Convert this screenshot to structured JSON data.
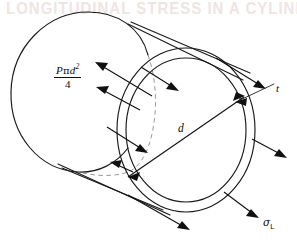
{
  "figure": {
    "kind": "engineering-diagram",
    "background_color": "#ffffff",
    "line_color": "#1a1a1a",
    "hidden_line_color": "#8a8a8a",
    "scan_artifact_text": "LONGITUDINAL STRESS IN A CYLINDER"
  },
  "labels": {
    "force": {
      "numerator_p": "P",
      "numerator_pi": "π",
      "numerator_d": "d",
      "numerator_exponent": "2",
      "denominator": "4",
      "plain": "Pπd²/4",
      "meaning": "end-cap-pressure-force"
    },
    "thickness": {
      "text": "t",
      "meaning": "wall-thickness"
    },
    "diameter": {
      "text": "d",
      "meaning": "internal-diameter"
    },
    "stress": {
      "symbol": "σ",
      "subscript": "L",
      "plain": "σL",
      "meaning": "longitudinal-stress"
    }
  },
  "geometry": {
    "near_ring": {
      "center_x": 186,
      "center_y": 130,
      "outer_rx": 69,
      "outer_ry": 82,
      "inner_rx": 60,
      "inner_ry": 72
    },
    "far_ellipse": {
      "center_x": 80,
      "center_y": 92,
      "rx": 70,
      "ry": 80
    },
    "diameter_line": {
      "x1": 126,
      "y1": 176,
      "x2": 246,
      "y2": 95
    }
  },
  "arrows": {
    "pressure_inward": [
      {
        "label": "upper-left-pressure-arrow",
        "x1": 95,
        "y1": 62,
        "x2": 148,
        "y2": 93
      },
      {
        "label": "mid-left-pressure-arrow",
        "x1": 108,
        "y1": 128,
        "x2": 152,
        "y2": 154
      },
      {
        "label": "inner-top-pressure-arrow",
        "x1": 142,
        "y1": 68,
        "x2": 178,
        "y2": 88
      }
    ],
    "stress_outward": [
      {
        "label": "top-right-stress-arrow",
        "x1": 222,
        "y1": 62,
        "x2": 272,
        "y2": 92
      },
      {
        "label": "right-stress-arrow",
        "x1": 255,
        "y1": 140,
        "x2": 288,
        "y2": 158
      },
      {
        "label": "bottom-right-stress-arrow",
        "x1": 225,
        "y1": 195,
        "x2": 262,
        "y2": 222
      },
      {
        "label": "bottom-stress-arrow",
        "x1": 128,
        "y1": 196,
        "x2": 192,
        "y2": 232
      }
    ]
  }
}
